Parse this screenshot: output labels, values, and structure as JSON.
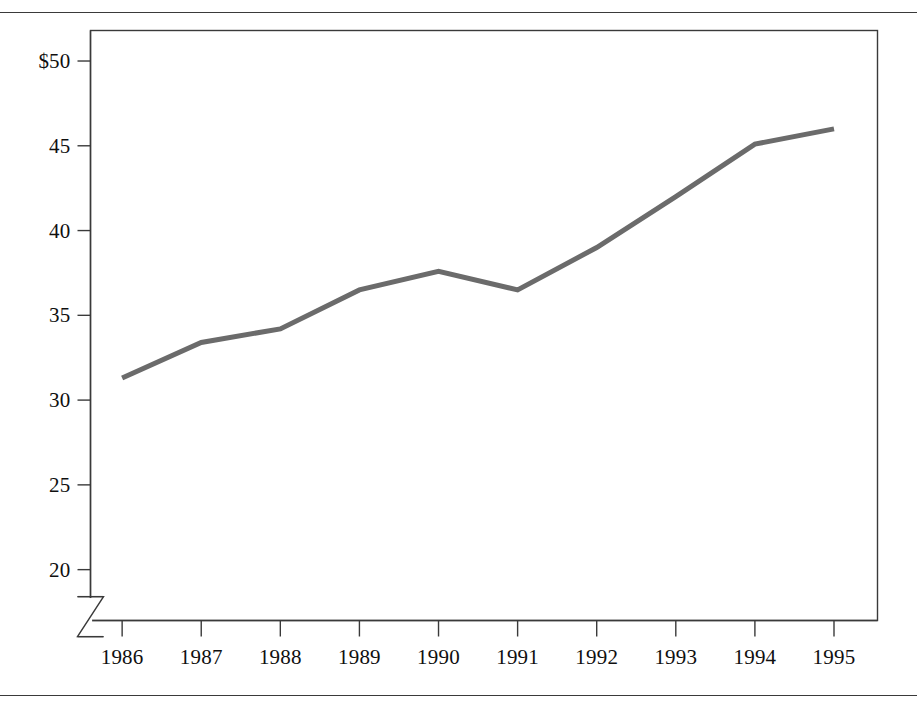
{
  "figure": {
    "background_color": "#ffffff",
    "rules": {
      "top_rule": "horizontal-rule",
      "bottom_rule": "horizontal-rule",
      "color": "#3a3a3a"
    }
  },
  "chart_data": {
    "type": "line",
    "title": "",
    "subtitle": "",
    "xlabel": "",
    "ylabel": "",
    "categories": [
      "1986",
      "1987",
      "1988",
      "1989",
      "1990",
      "1991",
      "1992",
      "1993",
      "1994",
      "1995"
    ],
    "x": [
      1986,
      1987,
      1988,
      1989,
      1990,
      1991,
      1992,
      1993,
      1994,
      1995
    ],
    "values": [
      31.3,
      33.4,
      34.2,
      36.5,
      37.6,
      36.5,
      39.0,
      42.0,
      45.1,
      46.0
    ],
    "series": [
      {
        "name": "",
        "values": [
          31.3,
          33.4,
          34.2,
          36.5,
          37.6,
          36.5,
          39.0,
          42.0,
          45.1,
          46.0
        ],
        "color": "#6b6b6b",
        "line_width": 5
      }
    ],
    "ylim": [
      17.0,
      51.8
    ],
    "xlim": [
      1985.6,
      1995.55
    ],
    "y_ticks": [
      20,
      25,
      30,
      35,
      40,
      45,
      50
    ],
    "y_tick_labels": [
      "20",
      "25",
      "30",
      "35",
      "40",
      "45",
      "$50"
    ],
    "x_ticks": [
      1986,
      1987,
      1988,
      1989,
      1990,
      1991,
      1992,
      1993,
      1994,
      1995
    ],
    "x_tick_labels": [
      "1986",
      "1987",
      "1988",
      "1989",
      "1990",
      "1991",
      "1992",
      "1993",
      "1994",
      "1995"
    ],
    "grid": false,
    "legend": null,
    "legend_position": "none",
    "annotations": [
      {
        "kind": "axis-break",
        "axis": "y",
        "description": "zigzag break symbol on the y-axis below the 20 tick"
      }
    ],
    "currency_prefix": "$",
    "axis_color": "#3a3a3a",
    "frame": true
  }
}
